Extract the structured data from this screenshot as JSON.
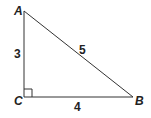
{
  "diagram": {
    "type": "right-triangle",
    "vertices": {
      "A": {
        "label": "A",
        "x": 24,
        "y": 11
      },
      "B": {
        "label": "B",
        "x": 133,
        "y": 97
      },
      "C": {
        "label": "C",
        "x": 24,
        "y": 97
      }
    },
    "sides": {
      "AC": {
        "label": "3"
      },
      "CB": {
        "label": "4"
      },
      "AB": {
        "label": "5"
      }
    },
    "right_angle_at": "C",
    "stroke_color": "#333333"
  }
}
